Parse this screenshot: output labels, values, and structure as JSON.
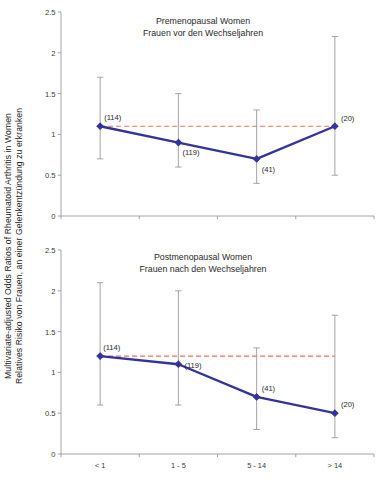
{
  "figure": {
    "ylabel_line1": "Multivariate-adjusted Odds Ratios of Rheumatoid Arthritis in Women",
    "ylabel_line2": "Relatives Risiko von Frauen, an einer Gelenkentzündung zu erkranken",
    "colors": {
      "series": "#333399",
      "marker": "#333399",
      "reference_line": "#E8765A",
      "error_bar": "#9a9a9a",
      "axis": "#9a9a9a",
      "text": "#2a2a2a"
    }
  },
  "chart_data": [
    {
      "type": "line",
      "id": "premenopausal",
      "title": "Premenopausal Women",
      "subtitle": "Frauen vor den Wechseljahren",
      "xlabel": "",
      "ylabel": "Multivariate-adjusted Odds Ratios of Rheumatoid Arthritis in Women",
      "categories": [
        "< 1",
        "1 - 5",
        "5 - 14",
        "> 14"
      ],
      "show_xticklabels": false,
      "values": [
        1.1,
        0.9,
        0.7,
        1.1
      ],
      "error_low": [
        0.7,
        0.6,
        0.4,
        0.5
      ],
      "error_high": [
        1.7,
        1.5,
        1.3,
        2.2
      ],
      "point_labels": [
        "(114)",
        "(119)",
        "(41)",
        "(20)"
      ],
      "reference_line": 1.1,
      "ylim": [
        0,
        2.5
      ],
      "yticks": [
        0,
        0.5,
        1,
        1.5,
        2,
        2.5
      ],
      "yticklabels": [
        "0",
        "0.5",
        "1",
        "1.5",
        "2",
        "2.5"
      ],
      "grid": false,
      "legend": "none"
    },
    {
      "type": "line",
      "id": "postmenopausal",
      "title": "Postmenopausal Women",
      "subtitle": "Frauen nach den Wechseljahren",
      "xlabel": "",
      "ylabel": "Relatives Risiko von Frauen, an einer Gelenkentzündung zu erkranken",
      "categories": [
        "< 1",
        "1 - 5",
        "5 - 14",
        "> 14"
      ],
      "show_xticklabels": true,
      "values": [
        1.2,
        1.1,
        0.7,
        0.5
      ],
      "error_low": [
        0.6,
        0.6,
        0.3,
        0.2
      ],
      "error_high": [
        2.1,
        2.0,
        1.3,
        1.7
      ],
      "point_labels": [
        "(114)",
        "(119)",
        "(41)",
        "(20)"
      ],
      "reference_line": 1.2,
      "ylim": [
        0,
        2.5
      ],
      "yticks": [
        0,
        0.5,
        1,
        1.5,
        2,
        2.5
      ],
      "yticklabels": [
        "0",
        "0.5",
        "1",
        "1.5",
        "2",
        "2.5"
      ],
      "grid": false,
      "legend": "none"
    }
  ]
}
